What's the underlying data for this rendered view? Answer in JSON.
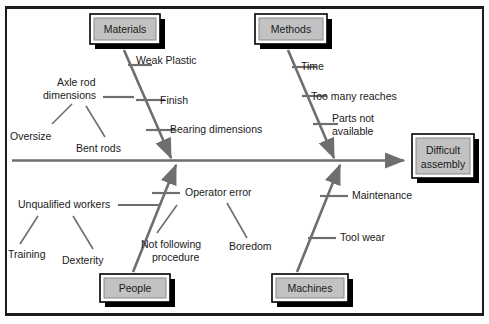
{
  "diagram": {
    "type": "fishbone-cause-and-effect",
    "effect": {
      "label_line1": "Difficult",
      "label_line2": "assembly"
    },
    "colors": {
      "line": "#6e6e6e",
      "box_fill": "#c2c2c2",
      "box_border": "#000000",
      "text": "#1a1a1a",
      "frame": "#1c1c1c"
    },
    "categories": [
      {
        "name": "Materials",
        "position": "top-left",
        "causes": [
          {
            "label": "Weak Plastic"
          },
          {
            "label": "Finish"
          },
          {
            "label": "Bearing dimensions"
          },
          {
            "label_line1": "Axle rod",
            "label_line2": "dimensions",
            "sub_causes": [
              {
                "label": "Oversize"
              },
              {
                "label": "Bent rods"
              }
            ]
          }
        ]
      },
      {
        "name": "Methods",
        "position": "top-right",
        "causes": [
          {
            "label": "Time"
          },
          {
            "label": "Too many reaches"
          },
          {
            "label_line1": "Parts not",
            "label_line2": "available"
          }
        ]
      },
      {
        "name": "People",
        "position": "bottom-left",
        "causes": [
          {
            "label": "Unqualified workers",
            "sub_causes": [
              {
                "label": "Training"
              },
              {
                "label": "Dexterity"
              }
            ]
          },
          {
            "label": "Operator error",
            "sub_causes": [
              {
                "label_line1": "Not following",
                "label_line2": "procedure"
              },
              {
                "label": "Boredom"
              }
            ]
          }
        ]
      },
      {
        "name": "Machines",
        "position": "bottom-right",
        "causes": [
          {
            "label": "Maintenance"
          },
          {
            "label": "Tool wear"
          }
        ]
      }
    ]
  }
}
